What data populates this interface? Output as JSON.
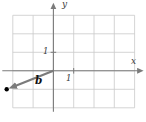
{
  "chart_data": {
    "type": "vector-diagram",
    "grid": true,
    "x_range": [
      -2,
      4
    ],
    "y_range": [
      -2,
      3
    ],
    "x_axis_label": "x",
    "y_axis_label": "y",
    "x_ticks_labeled": [
      "1"
    ],
    "y_ticks_labeled": [
      "1"
    ],
    "vectors": [
      {
        "name": "b",
        "from": [
          0,
          0
        ],
        "to": [
          -2.3,
          -1
        ]
      }
    ],
    "points": [
      {
        "at": [
          -2.3,
          -1
        ],
        "style": "filled-dot",
        "color": "#000000"
      }
    ],
    "colors": {
      "grid": "#c9c9c9",
      "axis": "#7b7b7b",
      "vector": "#7b7b7b",
      "point": "#000000",
      "label": "#3a3a3a"
    }
  }
}
